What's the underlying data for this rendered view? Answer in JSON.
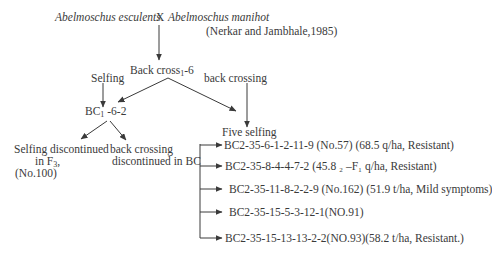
{
  "diagram": {
    "type": "breeding-pedigree-flowchart",
    "parents": {
      "female": "Abelmoschus esculents",
      "cross_symbol": "X",
      "male": "Abelmoschus manihot"
    },
    "citation": "(Nerkar and Jambhale,1985)",
    "nodes": {
      "backcross": {
        "prefix": "Back cross",
        "sub": "1",
        "suffix": "-6"
      },
      "bc1_6_2": {
        "prefix": "BC",
        "sub": "1",
        "suffix": " -6-2"
      },
      "five_selfing": "Five selfing",
      "selfing_discontinued": {
        "line1": "Selfing discontinued",
        "line2_prefix": "in F",
        "line2_sub": "3",
        "line2_suffix": ",",
        "line3": "(No.100)"
      },
      "backcrossing_discontinued": {
        "line1": "back crossing",
        "line2": "discontinued in BC"
      }
    },
    "edge_labels": {
      "selfing": "Selfing",
      "back_crossing": "back crossing"
    },
    "selections": [
      "BC2-35-6-1-2-11-9 (No.57) (68.5 q/ha, Resistant)",
      "BC2-35-8-4-4-7-2 (45.8 ₂ –F₁ q/ha, Resistant)",
      "BC2-35-11-8-2-2-9 (No.162) (51.9 t/ha, Mild symptoms)",
      "BC2-35-15-5-3-12-1(NO.91)",
      "BC2-35-15-13-13-2-2(NO.93)(58.2 t/ha, Resistant.)"
    ],
    "colors": {
      "ink": "#3a3a3a",
      "background": "#ffffff"
    }
  }
}
